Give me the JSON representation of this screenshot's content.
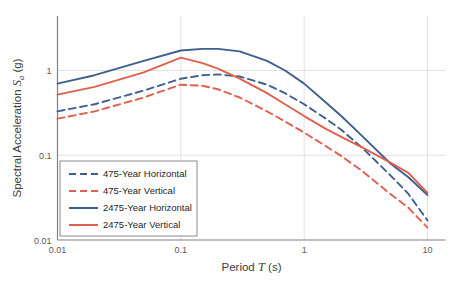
{
  "chart_data": {
    "type": "line",
    "title": "",
    "xlabel": "Period T (s)",
    "xlabel_parts": {
      "pre": "Period ",
      "symbol": "T",
      "post": " (s)"
    },
    "ylabel": "Spectral Acceleration Sa (g)",
    "ylabel_parts": {
      "pre": "Spectral Acceleration ",
      "symbol": "S",
      "subscript": "a",
      "post": " (g)"
    },
    "xscale": "log",
    "yscale": "log",
    "xlim": [
      0.01,
      10
    ],
    "ylim": [
      0.01,
      2.5
    ],
    "xticks": [
      "0.01",
      "0.1",
      "1",
      "10"
    ],
    "xtick_values": [
      0.01,
      0.1,
      1,
      10
    ],
    "yticks": [
      "1",
      "0.1",
      "0.01"
    ],
    "ytick_values": [
      1,
      0.1,
      0.01
    ],
    "grid": true,
    "grid_color": "#D9D9D9",
    "legend_position": "lower-left",
    "series": [
      {
        "name": "475-Year Horizontal",
        "color": "#3F5F8F",
        "style": "dashed",
        "x": [
          0.01,
          0.02,
          0.05,
          0.1,
          0.15,
          0.2,
          0.3,
          0.5,
          0.7,
          1.0,
          1.5,
          2.0,
          3.0,
          5.0,
          7.0,
          10.0
        ],
        "y": [
          0.33,
          0.4,
          0.58,
          0.8,
          0.88,
          0.9,
          0.85,
          0.68,
          0.54,
          0.4,
          0.27,
          0.2,
          0.12,
          0.058,
          0.035,
          0.017
        ]
      },
      {
        "name": "475-Year Vertical",
        "color": "#E0604F",
        "style": "dashed",
        "x": [
          0.01,
          0.02,
          0.05,
          0.1,
          0.15,
          0.2,
          0.3,
          0.5,
          0.7,
          1.0,
          1.5,
          2.0,
          3.0,
          5.0,
          7.0,
          10.0
        ],
        "y": [
          0.27,
          0.33,
          0.48,
          0.68,
          0.66,
          0.6,
          0.48,
          0.33,
          0.25,
          0.185,
          0.128,
          0.098,
          0.064,
          0.035,
          0.024,
          0.014
        ]
      },
      {
        "name": "2475-Year Horizontal",
        "color": "#3F5F8F",
        "style": "solid",
        "x": [
          0.01,
          0.02,
          0.05,
          0.1,
          0.15,
          0.2,
          0.3,
          0.5,
          0.7,
          1.0,
          1.5,
          2.0,
          3.0,
          5.0,
          7.0,
          10.0
        ],
        "y": [
          0.7,
          0.88,
          1.3,
          1.72,
          1.8,
          1.8,
          1.68,
          1.3,
          1.0,
          0.7,
          0.42,
          0.29,
          0.165,
          0.08,
          0.055,
          0.034
        ]
      },
      {
        "name": "2475-Year Vertical",
        "color": "#E0604F",
        "style": "solid",
        "x": [
          0.01,
          0.02,
          0.05,
          0.1,
          0.15,
          0.2,
          0.3,
          0.5,
          0.7,
          1.0,
          1.5,
          2.0,
          3.0,
          5.0,
          7.0,
          10.0
        ],
        "y": [
          0.52,
          0.64,
          0.95,
          1.42,
          1.22,
          1.05,
          0.8,
          0.54,
          0.4,
          0.29,
          0.205,
          0.165,
          0.122,
          0.082,
          0.062,
          0.036
        ]
      }
    ]
  },
  "legend": {
    "items": [
      {
        "label": "475-Year Horizontal",
        "color": "#3F5F8F",
        "style": "dashed"
      },
      {
        "label": "475-Year Vertical",
        "color": "#E0604F",
        "style": "dashed"
      },
      {
        "label": "2475-Year Horizontal",
        "color": "#3F5F8F",
        "style": "solid"
      },
      {
        "label": "2475-Year Vertical",
        "color": "#E0604F",
        "style": "solid"
      }
    ]
  },
  "colors": {
    "blue": "#3F5F8F",
    "red": "#E0604F",
    "axis": "#808080",
    "grid": "#D9D9D9",
    "text": "#404040"
  }
}
